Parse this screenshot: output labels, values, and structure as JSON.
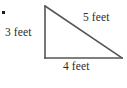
{
  "figure": {
    "name": "right-triangle-with-side-lengths",
    "background_color": "#ffffff",
    "stroke_color": "#555555",
    "text_color": "#2b2b2b",
    "bullet": {
      "visible": true,
      "color": "#1c1c1c"
    },
    "shape": {
      "type": "right-triangle",
      "vertices": {
        "top": [
          45,
          6
        ],
        "bottom_left": [
          45,
          58
        ],
        "bottom_right": [
          122,
          58
        ]
      },
      "right_angle_at": "bottom_left"
    },
    "labels": {
      "leg_vertical": "3 feet",
      "leg_horizontal": "4 feet",
      "hypotenuse": "5 feet"
    }
  }
}
